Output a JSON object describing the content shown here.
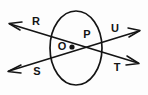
{
  "figure": {
    "kind": "circle-with-two-intersecting-secants",
    "background_color": "#fdfdfd",
    "stroke_color": "#141414",
    "width": 148,
    "height": 95,
    "circle": {
      "name": "circle-O",
      "center_x": 76,
      "center_y": 48,
      "radius": 37,
      "radius_y": 37
    },
    "center_point": {
      "label": "O",
      "dot_x": 72,
      "dot_y": 47,
      "label_x": 62,
      "label_y": 47
    },
    "intersection_point": {
      "label": "P",
      "x": 88,
      "y": 47,
      "label_x": 87,
      "label_y": 35
    },
    "secants": [
      {
        "name": "secant-RT",
        "through": [
          "R",
          "T"
        ],
        "x1": 10,
        "y1": 24,
        "x2": 138,
        "y2": 63,
        "arrow_start": true,
        "arrow_end": true
      },
      {
        "name": "secant-SU",
        "through": [
          "S",
          "U"
        ],
        "x1": 9,
        "y1": 71,
        "x2": 139,
        "y2": 31,
        "arrow_start": true,
        "arrow_end": true
      }
    ],
    "labels": [
      {
        "id": "label-R",
        "text": "R",
        "x": 36,
        "y": 22
      },
      {
        "id": "label-U",
        "text": "U",
        "x": 115,
        "y": 29
      },
      {
        "id": "label-O",
        "text": "O",
        "x": 62,
        "y": 47
      },
      {
        "id": "label-P",
        "text": "P",
        "x": 87,
        "y": 35
      },
      {
        "id": "label-S",
        "text": "S",
        "x": 37,
        "y": 72
      },
      {
        "id": "label-T",
        "text": "T",
        "x": 117,
        "y": 68
      }
    ]
  }
}
